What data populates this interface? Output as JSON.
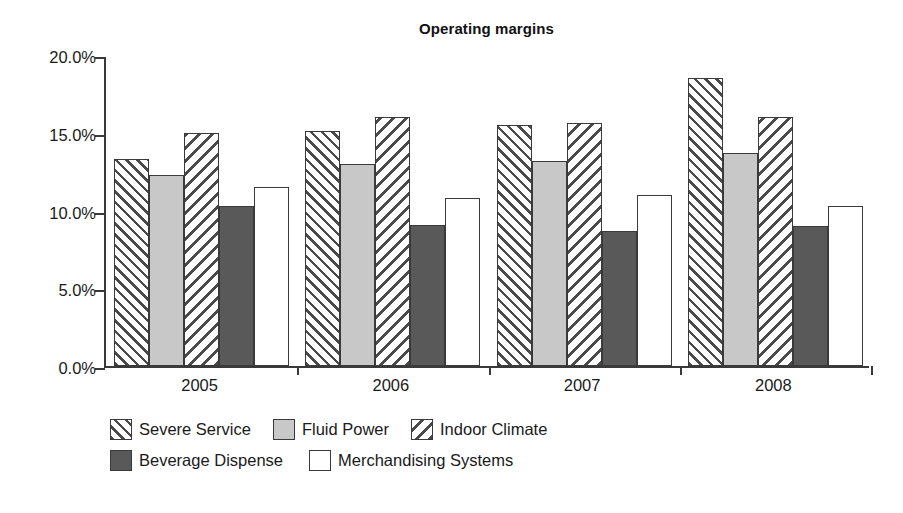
{
  "chart_data": {
    "type": "bar",
    "title": "Operating margins",
    "xlabel": "",
    "ylabel": "",
    "categories": [
      "2005",
      "2006",
      "2007",
      "2008"
    ],
    "ylim": [
      0,
      20
    ],
    "ytick_values": [
      0,
      5,
      10,
      15,
      20
    ],
    "ytick_labels": [
      "0.0%",
      "5.0%",
      "10.0%",
      "15.0%",
      "20.0%"
    ],
    "y_unit": "%",
    "grid": false,
    "legend_position": "bottom-left",
    "series": [
      {
        "name": "Severe Service",
        "fill": "hatch-forward",
        "color": "#ffffff",
        "values": [
          13.3,
          15.1,
          15.5,
          18.5
        ]
      },
      {
        "name": "Fluid Power",
        "fill": "solid",
        "color": "#c8c8c8",
        "values": [
          12.3,
          13.0,
          13.2,
          13.7
        ]
      },
      {
        "name": "Indoor Climate",
        "fill": "hatch-backward",
        "color": "#ffffff",
        "values": [
          15.0,
          16.0,
          15.6,
          16.0
        ]
      },
      {
        "name": "Beverage Dispense",
        "fill": "solid",
        "color": "#595959",
        "values": [
          10.3,
          9.1,
          8.7,
          9.0
        ]
      },
      {
        "name": "Merchandising Systems",
        "fill": "solid",
        "color": "#ffffff",
        "values": [
          11.5,
          10.8,
          11.0,
          10.3
        ]
      }
    ]
  }
}
